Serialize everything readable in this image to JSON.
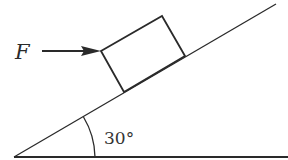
{
  "diagram": {
    "force_label": "F",
    "force_direction": "horizontal, pointing right toward block",
    "angle_label": "30°",
    "angle_value_deg": 30,
    "objects": [
      "inclined plane",
      "rectangular block",
      "horizontal force arrow",
      "angle arc"
    ],
    "colors": {
      "line": "#2a2a2a",
      "background": "#ffffff"
    }
  }
}
